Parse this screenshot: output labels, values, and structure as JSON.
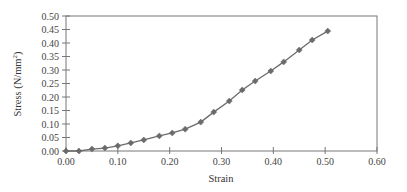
{
  "chart_data": {
    "type": "line",
    "title": "",
    "xlabel": "Strain",
    "ylabel": "Stress (N/mm²)",
    "ylabel_main": "Stress (N/mm",
    "ylabel_sup": "2",
    "ylabel_end": ")",
    "xlim": [
      0,
      0.6
    ],
    "ylim": [
      0,
      0.5
    ],
    "x_ticks": [
      "0.00",
      "0.10",
      "0.20",
      "0.30",
      "0.40",
      "0.50",
      "0.60"
    ],
    "y_ticks": [
      "0.00",
      "0.05",
      "0.10",
      "0.15",
      "0.20",
      "0.25",
      "0.30",
      "0.35",
      "0.40",
      "0.45",
      "0.50"
    ],
    "grid": false,
    "legend": null,
    "series": [
      {
        "name": "Stress-Strain",
        "color": "#6b6b6b",
        "marker": "diamond",
        "x": [
          0.0,
          0.025,
          0.05,
          0.075,
          0.1,
          0.125,
          0.15,
          0.18,
          0.205,
          0.23,
          0.26,
          0.285,
          0.315,
          0.34,
          0.365,
          0.395,
          0.42,
          0.45,
          0.475,
          0.505
        ],
        "y": [
          0.0,
          0.0,
          0.007,
          0.011,
          0.019,
          0.03,
          0.041,
          0.056,
          0.067,
          0.081,
          0.107,
          0.144,
          0.185,
          0.226,
          0.259,
          0.296,
          0.33,
          0.374,
          0.411,
          0.444
        ]
      }
    ]
  }
}
